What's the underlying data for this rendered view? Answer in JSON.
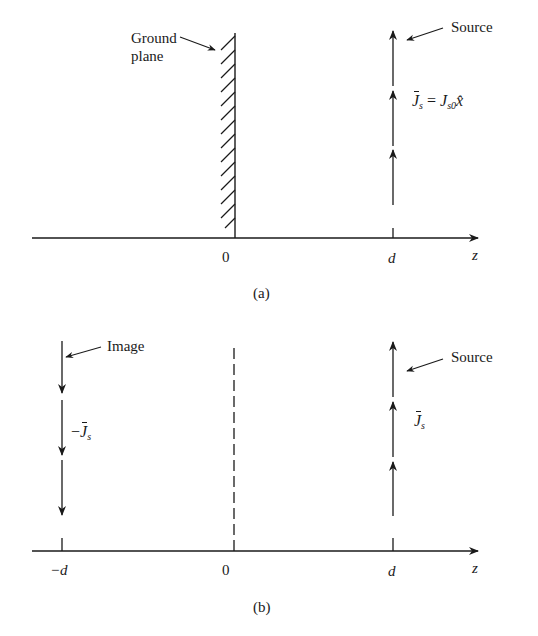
{
  "figure": {
    "panel_a": {
      "caption": "(a)",
      "ground_plane_label_line1": "Ground",
      "ground_plane_label_line2": "plane",
      "source_label": "Source",
      "current_label_J": "J",
      "current_label_sub": "s",
      "current_label_eq": " = ",
      "current_label_J2": "J",
      "current_label_sub2": "s0",
      "current_label_x": "x̂",
      "axis_label": "z",
      "tick_zero": "0",
      "tick_d": "d"
    },
    "panel_b": {
      "caption": "(b)",
      "image_label": "Image",
      "image_current_minus": "−",
      "image_current_J": "J",
      "image_current_sub": "s",
      "source_label": "Source",
      "source_current_J": "J",
      "source_current_sub": "s",
      "axis_label": "z",
      "tick_minus_d": "−d",
      "tick_zero": "0",
      "tick_d": "d"
    },
    "colors": {
      "ink": "#1a1a1a",
      "background": "#ffffff"
    }
  }
}
